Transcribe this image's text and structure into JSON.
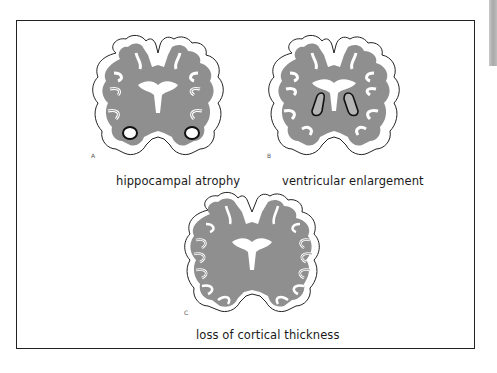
{
  "figure": {
    "panels": [
      {
        "letter": "A",
        "caption": "hippocampal atrophy",
        "feature": "enlarged-hippocampal-cavities"
      },
      {
        "letter": "B",
        "caption": "ventricular enlargement",
        "feature": "enlarged-lateral-ventricles"
      },
      {
        "letter": "C",
        "caption": "loss of cortical thickness",
        "feature": "thinned-cortex"
      }
    ],
    "colors": {
      "white_matter": "#8f8f8f",
      "cortex": "#ffffff",
      "outline": "#222222",
      "ventricle_fill": "#b5b5b5",
      "frame": "#222222"
    }
  }
}
